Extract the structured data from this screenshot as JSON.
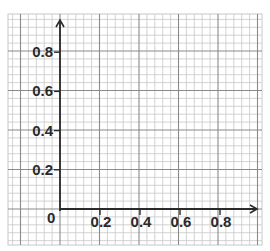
{
  "graph": {
    "colors": {
      "background": "#ffffff",
      "minor_grid": "#c8c8c8",
      "major_grid": "#8a8a8a",
      "axis": "#2a2a2a",
      "text": "#2a2a2a"
    },
    "grid": {
      "left": 8,
      "top": 14,
      "right": 262,
      "bottom": 245,
      "cell": 7.9,
      "major_every": 5
    },
    "origin": {
      "x": 60,
      "y": 209,
      "label": "0"
    },
    "x_axis": {
      "unit_px": 200,
      "ticks": [
        {
          "value": 0.2,
          "label": "0.2"
        },
        {
          "value": 0.4,
          "label": "0.4"
        },
        {
          "value": 0.6,
          "label": "0.6"
        },
        {
          "value": 0.8,
          "label": "0.8"
        }
      ]
    },
    "y_axis": {
      "unit_px": 196,
      "ticks": [
        {
          "value": 0.2,
          "label": "0.2"
        },
        {
          "value": 0.4,
          "label": "0.4"
        },
        {
          "value": 0.6,
          "label": "0.6"
        },
        {
          "value": 0.8,
          "label": "0.8"
        }
      ]
    }
  }
}
